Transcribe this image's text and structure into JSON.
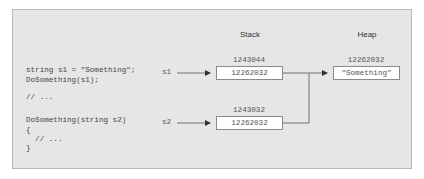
{
  "headers": {
    "stack": "Stack",
    "heap": "Heap"
  },
  "code_lines": [
    "string s1 = \"Something\";",
    "DoSomething(s1);",
    "// ...",
    "DoSomething(string s2)",
    "{",
    "  // ...",
    "}"
  ],
  "variables": {
    "s1": "s1",
    "s2": "s2"
  },
  "stack": [
    {
      "address": "1243044",
      "value": "12262032"
    },
    {
      "address": "1243032",
      "value": "12262032"
    }
  ],
  "heap": [
    {
      "address": "12262032",
      "value": "\"Something\""
    }
  ],
  "colors": {
    "panel_bg": "#e6e6e6",
    "panel_border": "#b8b8b8",
    "line": "#666666",
    "box_bg": "#ffffff"
  }
}
